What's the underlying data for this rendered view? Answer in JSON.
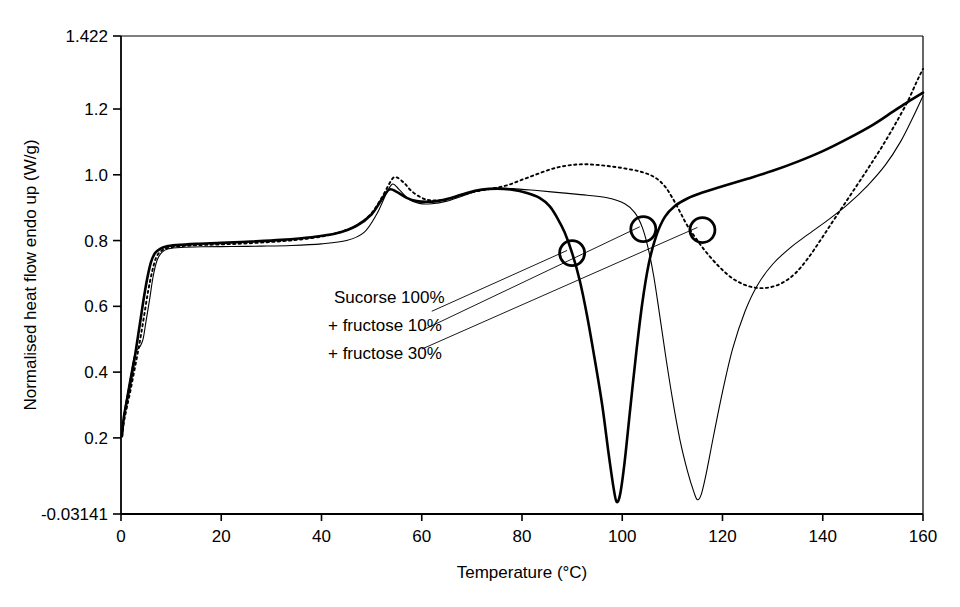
{
  "chart_data": {
    "type": "line",
    "title": "",
    "xlabel": "Temperature (°C)",
    "ylabel": "Normalised heat flow endo up (W/g)",
    "xlim": [
      0,
      160
    ],
    "ylim": [
      -0.03141,
      1.422
    ],
    "grid": false,
    "legend_position": "inside-center-left",
    "xticks": [
      0,
      20,
      40,
      60,
      80,
      100,
      120,
      140,
      160
    ],
    "xtick_labels": [
      "0",
      "20",
      "40",
      "60",
      "80",
      "100",
      "120",
      "140",
      "160"
    ],
    "yticks": [
      -0.03141,
      0.2,
      0.4,
      0.6,
      0.8,
      1.0,
      1.2,
      1.422
    ],
    "ytick_labels": [
      "-0.03141",
      "0.2",
      "0.4",
      "0.6",
      "0.8",
      "1.0",
      "1.2",
      "1.422"
    ],
    "series": [
      {
        "name": "Sucorse 100%",
        "style": "solid-thick",
        "color": "#000000",
        "points": [
          [
            0.2,
            0.205
          ],
          [
            0.5,
            0.255
          ],
          [
            1.0,
            0.3
          ],
          [
            1.6,
            0.345
          ],
          [
            2.2,
            0.395
          ],
          [
            2.8,
            0.45
          ],
          [
            3.4,
            0.51
          ],
          [
            4.0,
            0.57
          ],
          [
            4.6,
            0.63
          ],
          [
            5.3,
            0.69
          ],
          [
            6.0,
            0.735
          ],
          [
            6.8,
            0.762
          ],
          [
            7.8,
            0.775
          ],
          [
            9.0,
            0.782
          ],
          [
            11.0,
            0.786
          ],
          [
            15.0,
            0.79
          ],
          [
            20.0,
            0.793
          ],
          [
            26.0,
            0.797
          ],
          [
            32.0,
            0.802
          ],
          [
            38.0,
            0.81
          ],
          [
            43.0,
            0.822
          ],
          [
            47.0,
            0.845
          ],
          [
            50.0,
            0.88
          ],
          [
            52.0,
            0.925
          ],
          [
            53.5,
            0.955
          ],
          [
            55.0,
            0.948
          ],
          [
            57.0,
            0.93
          ],
          [
            59.0,
            0.92
          ],
          [
            61.0,
            0.918
          ],
          [
            63.0,
            0.92
          ],
          [
            66.0,
            0.93
          ],
          [
            69.0,
            0.945
          ],
          [
            72.0,
            0.955
          ],
          [
            75.0,
            0.958
          ],
          [
            78.0,
            0.955
          ],
          [
            81.0,
            0.945
          ],
          [
            83.5,
            0.93
          ],
          [
            85.5,
            0.905
          ],
          [
            87.0,
            0.87
          ],
          [
            88.5,
            0.825
          ],
          [
            90.0,
            0.762
          ],
          [
            91.5,
            0.68
          ],
          [
            93.0,
            0.57
          ],
          [
            94.5,
            0.44
          ],
          [
            96.0,
            0.3
          ],
          [
            97.3,
            0.15
          ],
          [
            98.3,
            0.045
          ],
          [
            98.9,
            0.005
          ],
          [
            99.6,
            0.03
          ],
          [
            100.5,
            0.13
          ],
          [
            101.6,
            0.29
          ],
          [
            102.8,
            0.46
          ],
          [
            104.0,
            0.61
          ],
          [
            105.3,
            0.73
          ],
          [
            106.8,
            0.815
          ],
          [
            108.5,
            0.872
          ],
          [
            110.5,
            0.905
          ],
          [
            113.0,
            0.928
          ],
          [
            116.0,
            0.946
          ],
          [
            120.0,
            0.965
          ],
          [
            125.0,
            0.988
          ],
          [
            130.0,
            1.012
          ],
          [
            135.0,
            1.04
          ],
          [
            140.0,
            1.072
          ],
          [
            145.0,
            1.11
          ],
          [
            150.0,
            1.152
          ],
          [
            154.0,
            1.192
          ],
          [
            157.0,
            1.222
          ],
          [
            160.0,
            1.25
          ]
        ]
      },
      {
        "name": "+ fructose 10%",
        "style": "solid-thin",
        "color": "#000000",
        "points": [
          [
            0.2,
            0.205
          ],
          [
            0.6,
            0.27
          ],
          [
            1.2,
            0.33
          ],
          [
            1.9,
            0.39
          ],
          [
            2.6,
            0.445
          ],
          [
            3.2,
            0.468
          ],
          [
            3.8,
            0.478
          ],
          [
            4.4,
            0.5
          ],
          [
            5.0,
            0.555
          ],
          [
            5.7,
            0.62
          ],
          [
            6.4,
            0.69
          ],
          [
            7.2,
            0.74
          ],
          [
            8.2,
            0.765
          ],
          [
            9.5,
            0.775
          ],
          [
            12.0,
            0.779
          ],
          [
            16.0,
            0.781
          ],
          [
            22.0,
            0.782
          ],
          [
            28.0,
            0.783
          ],
          [
            34.0,
            0.785
          ],
          [
            40.0,
            0.79
          ],
          [
            45.0,
            0.8
          ],
          [
            48.5,
            0.825
          ],
          [
            51.0,
            0.88
          ],
          [
            53.0,
            0.945
          ],
          [
            54.2,
            0.972
          ],
          [
            55.5,
            0.955
          ],
          [
            57.5,
            0.925
          ],
          [
            59.5,
            0.913
          ],
          [
            62.0,
            0.912
          ],
          [
            65.0,
            0.92
          ],
          [
            68.0,
            0.935
          ],
          [
            71.0,
            0.95
          ],
          [
            74.0,
            0.958
          ],
          [
            78.0,
            0.958
          ],
          [
            83.0,
            0.952
          ],
          [
            88.0,
            0.945
          ],
          [
            93.0,
            0.938
          ],
          [
            97.0,
            0.93
          ],
          [
            100.5,
            0.912
          ],
          [
            102.5,
            0.885
          ],
          [
            104.0,
            0.84
          ],
          [
            105.2,
            0.775
          ],
          [
            106.3,
            0.69
          ],
          [
            107.4,
            0.58
          ],
          [
            108.6,
            0.455
          ],
          [
            110.0,
            0.32
          ],
          [
            111.5,
            0.195
          ],
          [
            113.0,
            0.1
          ],
          [
            114.3,
            0.035
          ],
          [
            115.0,
            0.012
          ],
          [
            115.8,
            0.03
          ],
          [
            116.8,
            0.095
          ],
          [
            118.2,
            0.205
          ],
          [
            120.0,
            0.34
          ],
          [
            122.0,
            0.47
          ],
          [
            124.5,
            0.585
          ],
          [
            127.0,
            0.665
          ],
          [
            130.0,
            0.728
          ],
          [
            133.5,
            0.778
          ],
          [
            137.0,
            0.818
          ],
          [
            141.0,
            0.862
          ],
          [
            145.0,
            0.91
          ],
          [
            149.0,
            0.968
          ],
          [
            152.5,
            1.03
          ],
          [
            155.5,
            1.1
          ],
          [
            158.0,
            1.175
          ],
          [
            160.0,
            1.24
          ]
        ]
      },
      {
        "name": "+ fructose 30%",
        "style": "dotted",
        "color": "#000000",
        "points": [
          [
            0.2,
            0.205
          ],
          [
            0.6,
            0.25
          ],
          [
            1.2,
            0.295
          ],
          [
            1.9,
            0.345
          ],
          [
            2.6,
            0.4
          ],
          [
            3.3,
            0.455
          ],
          [
            4.0,
            0.515
          ],
          [
            4.7,
            0.58
          ],
          [
            5.4,
            0.645
          ],
          [
            6.2,
            0.705
          ],
          [
            7.0,
            0.748
          ],
          [
            8.0,
            0.768
          ],
          [
            9.5,
            0.778
          ],
          [
            12.0,
            0.783
          ],
          [
            17.0,
            0.787
          ],
          [
            23.0,
            0.79
          ],
          [
            29.0,
            0.795
          ],
          [
            35.0,
            0.802
          ],
          [
            41.0,
            0.815
          ],
          [
            46.0,
            0.838
          ],
          [
            49.5,
            0.875
          ],
          [
            52.0,
            0.93
          ],
          [
            54.0,
            0.985
          ],
          [
            55.0,
            0.992
          ],
          [
            56.5,
            0.975
          ],
          [
            58.0,
            0.95
          ],
          [
            60.0,
            0.93
          ],
          [
            62.0,
            0.922
          ],
          [
            65.0,
            0.925
          ],
          [
            68.0,
            0.938
          ],
          [
            71.0,
            0.95
          ],
          [
            74.0,
            0.958
          ],
          [
            77.0,
            0.968
          ],
          [
            80.0,
            0.985
          ],
          [
            83.0,
            1.002
          ],
          [
            86.0,
            1.018
          ],
          [
            89.0,
            1.028
          ],
          [
            92.0,
            1.032
          ],
          [
            95.0,
            1.03
          ],
          [
            98.0,
            1.025
          ],
          [
            101.0,
            1.018
          ],
          [
            104.0,
            1.008
          ],
          [
            106.5,
            0.992
          ],
          [
            108.5,
            0.965
          ],
          [
            110.0,
            0.93
          ],
          [
            111.5,
            0.888
          ],
          [
            113.0,
            0.845
          ],
          [
            115.0,
            0.8
          ],
          [
            117.0,
            0.76
          ],
          [
            119.5,
            0.718
          ],
          [
            122.0,
            0.685
          ],
          [
            124.5,
            0.665
          ],
          [
            127.0,
            0.656
          ],
          [
            129.5,
            0.658
          ],
          [
            132.0,
            0.672
          ],
          [
            134.5,
            0.7
          ],
          [
            137.0,
            0.745
          ],
          [
            139.5,
            0.8
          ],
          [
            142.0,
            0.858
          ],
          [
            144.5,
            0.915
          ],
          [
            147.0,
            0.972
          ],
          [
            149.5,
            1.03
          ],
          [
            152.0,
            1.09
          ],
          [
            154.5,
            1.155
          ],
          [
            157.0,
            1.225
          ],
          [
            158.8,
            1.285
          ],
          [
            160.0,
            1.322
          ]
        ]
      }
    ],
    "annotations": {
      "onset_markers": [
        {
          "label": "onset-sucrose-100",
          "x": 90.0,
          "y": 0.762
        },
        {
          "label": "onset-fructose-10",
          "x": 104.2,
          "y": 0.835
        },
        {
          "label": "onset-fructose-30",
          "x": 116.0,
          "y": 0.832
        }
      ],
      "legend_leader_lines": [
        {
          "from_x": 62.0,
          "from_y": 0.585,
          "to_x": 89.0,
          "to_y": 0.77
        },
        {
          "from_x": 60.5,
          "from_y": 0.53,
          "to_x": 103.5,
          "to_y": 0.842
        },
        {
          "from_x": 60.0,
          "from_y": 0.47,
          "to_x": 115.0,
          "to_y": 0.84
        }
      ]
    }
  },
  "legend": {
    "lines": [
      "Sucorse 100%",
      "+ fructose 10%",
      "+ fructose 30%"
    ]
  },
  "axes": {
    "x_title": "Temperature (°C)",
    "y_title": "Normalised heat flow endo up (W/g)"
  }
}
